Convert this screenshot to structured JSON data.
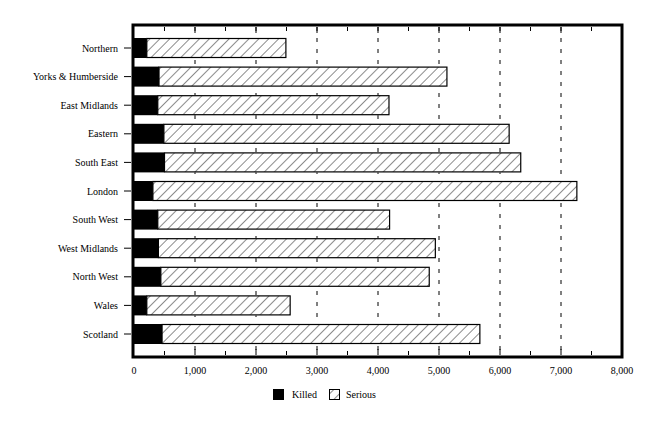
{
  "chart_data": {
    "type": "bar",
    "orientation": "horizontal",
    "stacked": true,
    "title": "",
    "xlabel": "",
    "ylabel": "",
    "categories": [
      "Northern",
      "Yorks & Humberside",
      "East Midlands",
      "Eastern",
      "South East",
      "London",
      "South West",
      "West Midlands",
      "North West",
      "Wales",
      "Scotland"
    ],
    "series": [
      {
        "name": "Killed",
        "color": "#000000",
        "pattern": "solid",
        "values": [
          210,
          410,
          390,
          490,
          500,
          310,
          390,
          400,
          440,
          210,
          460
        ]
      },
      {
        "name": "Serious",
        "color": "#ffffff",
        "pattern": "diagonal-hatch",
        "values": [
          2280,
          4720,
          3790,
          5660,
          5840,
          6950,
          3800,
          4540,
          4400,
          2350,
          5210
        ]
      }
    ],
    "xlim": [
      0,
      8000
    ],
    "xticks": [
      0,
      1000,
      2000,
      3000,
      4000,
      5000,
      6000,
      7000,
      8000
    ],
    "xtick_labels": [
      "0",
      "1,000",
      "2,000",
      "3,000",
      "4,000",
      "5,000",
      "6,000",
      "7,000",
      "8,000"
    ],
    "grid": "vertical dashed lines at 3,000–7,000 (visible where no bar)",
    "legend": {
      "position": "bottom-center",
      "entries": [
        "Killed",
        "Serious"
      ]
    }
  },
  "legend": {
    "killed": "Killed",
    "serious": "Serious"
  }
}
